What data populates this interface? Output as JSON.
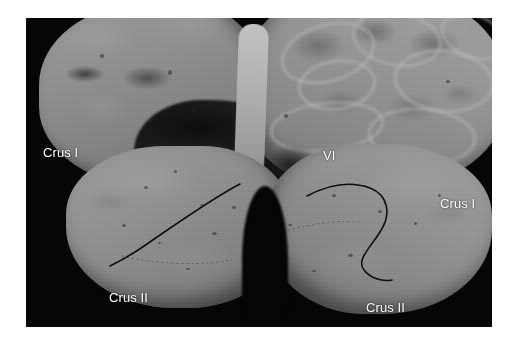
{
  "figure": {
    "kind": "anatomical-photograph",
    "plate": {
      "background_color": "#050505",
      "page_color": "#ffffff",
      "tissue_color": "#8e8e8e",
      "label_color": "#ffffff",
      "fissure_line_color": "#101010"
    },
    "labels": [
      {
        "id": "crus1-left",
        "text": "Crus I",
        "side": "left",
        "structure": "Crus I of the ansiform lobule"
      },
      {
        "id": "crus1-right",
        "text": "Crus I",
        "side": "right",
        "structure": "Crus I of the ansiform lobule"
      },
      {
        "id": "crus2-left",
        "text": "Crus II",
        "side": "left",
        "structure": "Crus II of the ansiform lobule"
      },
      {
        "id": "crus2-right",
        "text": "Crus II",
        "side": "right",
        "structure": "Crus II of the ansiform lobule"
      },
      {
        "id": "vermis-vi",
        "text": "VI",
        "side": "center",
        "structure": "Lobule VI of the vermis"
      }
    ],
    "regions": [
      {
        "id": "upper-left-mass",
        "name": "upper left cerebral/cerebellar mass"
      },
      {
        "id": "upper-right-mass",
        "name": "upper right convoluted cortical mass"
      },
      {
        "id": "vermis-column",
        "name": "midline vermis"
      },
      {
        "id": "lower-left-hemisphere",
        "name": "left cerebellar hemisphere"
      },
      {
        "id": "lower-right-hemisphere",
        "name": "right cerebellar hemisphere"
      },
      {
        "id": "midline-notch",
        "name": "midline posterior notch"
      }
    ]
  }
}
